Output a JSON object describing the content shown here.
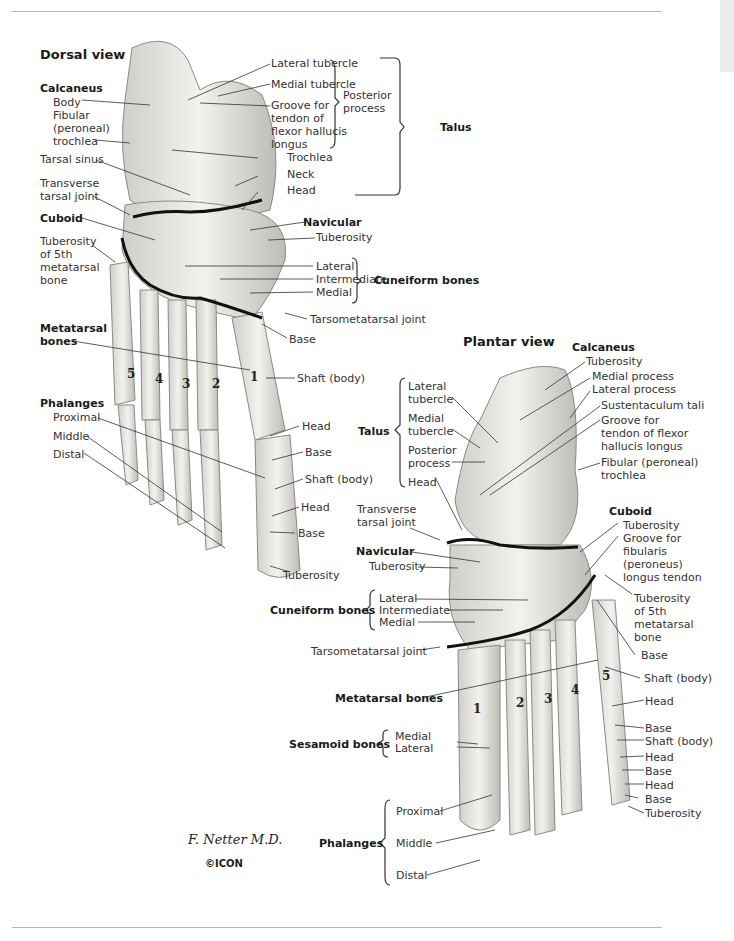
{
  "dorsal": {
    "title": "Dorsal view",
    "calcaneus": {
      "heading": "Calcaneus",
      "body": "Body",
      "fibular_trochlea": "Fibular\n(peroneal)\ntrochlea"
    },
    "tarsal_sinus": "Tarsal sinus",
    "transverse_tarsal_joint": "Transverse\ntarsal joint",
    "cuboid": "Cuboid",
    "tuberosity_5th": "Tuberosity\nof 5th\nmetatarsal\nbone",
    "metatarsal_bones": "Metatarsal\nbones",
    "metatarsal_numbers": [
      "5",
      "4",
      "3",
      "2",
      "1"
    ],
    "phalanges": {
      "heading": "Phalanges",
      "proximal": "Proximal",
      "middle": "Middle",
      "distal": "Distal"
    },
    "talus": {
      "heading": "Talus",
      "lateral_tubercle": "Lateral tubercle",
      "medial_tubercle": "Medial tubercle",
      "groove": "Groove for\ntendon of\nflexor hallucis\nlongus",
      "posterior_process": "Posterior\nprocess",
      "trochlea": "Trochlea",
      "neck": "Neck",
      "head": "Head"
    },
    "navicular": {
      "heading": "Navicular",
      "tuberosity": "Tuberosity"
    },
    "cuneiform": {
      "heading": "Cuneiform bones",
      "lateral": "Lateral",
      "intermediate": "Intermediate",
      "medial": "Medial"
    },
    "tarsometatarsal_joint": "Tarsometatarsal joint",
    "right_labels": {
      "base": "Base",
      "shaft": "Shaft (body)",
      "head1": "Head",
      "base2": "Base",
      "shaft2": "Shaft (body)",
      "head2": "Head",
      "base3": "Base",
      "tuberosity": "Tuberosity"
    }
  },
  "plantar": {
    "title": "Plantar view",
    "calcaneus": {
      "heading": "Calcaneus",
      "tuberosity": "Tuberosity",
      "medial_process": "Medial process",
      "lateral_process": "Lateral process",
      "sustentaculum": "Sustentaculum tali",
      "groove": "Groove for\ntendon of flexor\nhallucis longus",
      "fibular_trochlea": "Fibular (peroneal)\ntrochlea"
    },
    "talus": {
      "heading": "Talus",
      "lateral_tubercle": "Lateral\ntubercle",
      "medial_tubercle": "Medial\ntubercle",
      "posterior_process": "Posterior\nprocess",
      "head": "Head"
    },
    "transverse_tarsal_joint": "Transverse\ntarsal joint",
    "navicular": {
      "heading": "Navicular",
      "tuberosity": "Tuberosity"
    },
    "cuboid": {
      "heading": "Cuboid",
      "tuberosity": "Tuberosity",
      "groove": "Groove for\nfibularis\n(peroneus)\nlongus tendon"
    },
    "tuberosity_5th": "Tuberosity\nof 5th\nmetatarsal\nbone",
    "cuneiform": {
      "heading": "Cuneiform bones",
      "lateral": "Lateral",
      "intermediate": "Intermediate",
      "medial": "Medial"
    },
    "tarsometatarsal_joint": "Tarsometatarsal joint",
    "metatarsal_bones": "Metatarsal bones",
    "metatarsal_numbers": [
      "1",
      "2",
      "3",
      "4",
      "5"
    ],
    "sesamoid": {
      "heading": "Sesamoid bones",
      "medial": "Medial",
      "lateral": "Lateral"
    },
    "phalanges": {
      "heading": "Phalanges",
      "proximal": "Proximal",
      "middle": "Middle",
      "distal": "Distal"
    },
    "right_labels": {
      "base": "Base",
      "shaft": "Shaft (body)",
      "head": "Head",
      "base2": "Base",
      "shaft2": "Shaft (body)",
      "head2": "Head",
      "base3": "Base",
      "head3": "Head",
      "base4": "Base",
      "tuberosity": "Tuberosity"
    }
  },
  "signature": "F. Netter M.D.",
  "publisher_logo": "©ICON"
}
